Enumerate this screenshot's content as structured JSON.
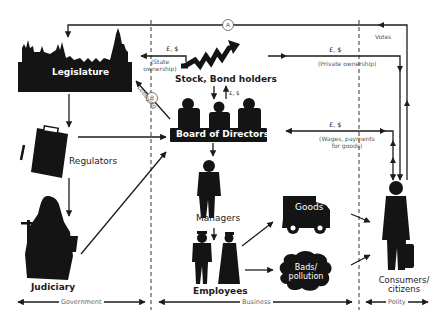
{
  "diagram": {
    "nodes": {
      "legislature": "Legislature",
      "regulators": "Regulators",
      "judiciary": "Judiciary",
      "stock_bond_holders": "Stock, Bond holders",
      "board_of_directors": "Board of Directors",
      "managers": "Managers",
      "employees": "Employees",
      "goods": "Goods",
      "bads_line1": "Bads/",
      "bads_line2": "pollution",
      "consumers_line1": "Consumers/",
      "consumers_line2": "citizens"
    },
    "flows": {
      "state_money": "£, $",
      "state_ownership_line1": "(State",
      "state_ownership_line2": "ownership)",
      "lobbying": "Lobbying",
      "marker_a": "A",
      "marker_b": "B",
      "votes": "Votes",
      "private_money": "£, $",
      "private_ownership": "(Private ownership)",
      "board_money": "£, $",
      "wages_money": "£, $",
      "wages_line1": "(Wages, payments",
      "wages_line2": "for goods)"
    },
    "sections": {
      "government": "Government",
      "business": "Business",
      "polity": "Polity"
    }
  }
}
